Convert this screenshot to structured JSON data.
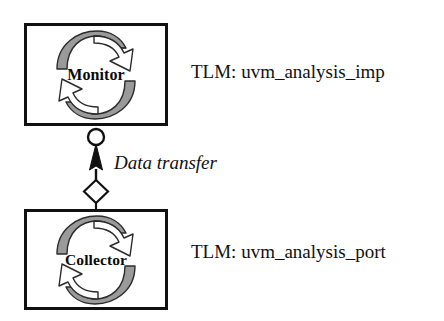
{
  "diagram": {
    "type": "uml-component-diagram",
    "background_color": "#ffffff",
    "stroke_color": "#111111",
    "icon_shade_color": "#9a9a9a"
  },
  "components": [
    {
      "id": "monitor",
      "label": "Monitor",
      "icon": "circular-arrows-icon",
      "tlm": {
        "label": "TLM: uvm_analysis_imp",
        "port_kind": "uvm_analysis_imp"
      }
    },
    {
      "id": "collector",
      "label": "Collector",
      "icon": "circular-arrows-icon",
      "tlm": {
        "label": "TLM: uvm_analysis_port",
        "port_kind": "uvm_analysis_port"
      }
    }
  ],
  "connector": {
    "label": "Data transfer",
    "direction": "collector-to-monitor",
    "socket_shape": "open-circle",
    "arrow_shape": "filled-arrowhead",
    "end_shape": "open-diamond"
  }
}
